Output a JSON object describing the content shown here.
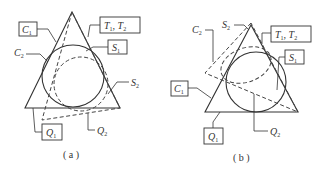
{
  "panels": [
    {
      "id": "a",
      "caption": "( a )",
      "labels": {
        "C1": {
          "main": "C",
          "sub": "1"
        },
        "C2": {
          "main": "C",
          "sub": "2"
        },
        "T": {
          "main": "T",
          "sub1": "1",
          "sep": ", ",
          "main2": "T",
          "sub2": "2"
        },
        "S1": {
          "main": "S",
          "sub": "1"
        },
        "S2": {
          "main": "S",
          "sub": "2"
        },
        "Q1": {
          "main": "Q",
          "sub": "1"
        },
        "Q2": {
          "main": "Q",
          "sub": "2"
        }
      }
    },
    {
      "id": "b",
      "caption": "( b )",
      "labels": {
        "C1": {
          "main": "C",
          "sub": "1"
        },
        "C2": {
          "main": "C",
          "sub": "2"
        },
        "T": {
          "main": "T",
          "sub1": "1",
          "sep": ", ",
          "main2": "T",
          "sub2": "2"
        },
        "S1": {
          "main": "S",
          "sub": "1"
        },
        "S2": {
          "main": "S",
          "sub": "2"
        },
        "Q1": {
          "main": "Q",
          "sub": "1"
        },
        "Q2": {
          "main": "Q",
          "sub": "2"
        }
      }
    }
  ],
  "colors": {
    "stroke": "#333333",
    "background": "#ffffff"
  }
}
